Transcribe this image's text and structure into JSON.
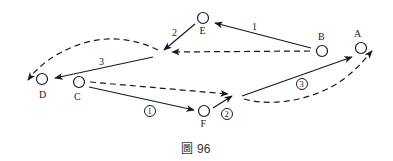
{
  "figure": {
    "caption_prefix": "圖",
    "caption_number": "96",
    "colors": {
      "stroke": "#1a1a1a",
      "background": "#ffffff"
    }
  },
  "nodes": [
    {
      "id": "E",
      "label": "E"
    },
    {
      "id": "B",
      "label": "B"
    },
    {
      "id": "A",
      "label": "A"
    },
    {
      "id": "D",
      "label": "D"
    },
    {
      "id": "C",
      "label": "C"
    },
    {
      "id": "F",
      "label": "F"
    }
  ],
  "edges": {
    "solid_upper": [
      {
        "from": "B",
        "to": "E",
        "label": "1"
      },
      {
        "from": "E",
        "to": "junction",
        "label": "2"
      },
      {
        "from": "junction",
        "to": "D",
        "label": "3"
      }
    ],
    "solid_lower": [
      {
        "from": "C",
        "to": "F",
        "label": "①"
      },
      {
        "from": "F",
        "to": "junction2",
        "label": "②"
      },
      {
        "from": "junction2",
        "to": "A",
        "label": "③"
      }
    ],
    "dashed": [
      {
        "from": "B",
        "to": "junction",
        "style": "dashed"
      },
      {
        "from": "junction",
        "to": "D",
        "style": "dashed-curve"
      },
      {
        "from": "C",
        "to": "junction2",
        "style": "dashed"
      },
      {
        "from": "junction2",
        "to": "A",
        "style": "dashed-curve"
      }
    ]
  }
}
